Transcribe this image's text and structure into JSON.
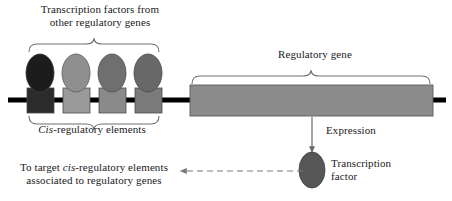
{
  "figure": {
    "background_color": "#ffffff",
    "width": 452,
    "height": 201
  },
  "labels": {
    "tf_source_line1": "Transcription factors from",
    "tf_source_line2": "other regulatory genes",
    "cis_elements_italic": "Cis",
    "cis_elements_rest": "-regulatory elements",
    "target_line1_pre": "To target ",
    "target_line1_italic": "cis",
    "target_line1_post": "-regulatory elements",
    "target_line2": "associated to regulatory genes",
    "regulatory_gene": "Regulatory gene",
    "expression": "Expression",
    "transcription_factor_line1": "Transcription",
    "transcription_factor_line2": "factor"
  },
  "colors": {
    "dna_strand": "#000000",
    "outline": "#4d4d4d",
    "brace": "#6e6e6e",
    "text": "#1a1a1a",
    "oval_1": "#1c1c1c",
    "oval_2": "#8f8f8f",
    "oval_3": "#6f6f6f",
    "oval_4": "#686868",
    "oval_product": "#575757",
    "box_1": "#2b2b2b",
    "box_2": "#9a9a9a",
    "box_3": "#8a8a8a",
    "box_4": "#7b7b7b",
    "regulatory_gene_fill": "#8c8c8c",
    "arrow": "#6a6a6a",
    "dashed_arrow": "#7a7a7a"
  },
  "elements": {
    "transcription_factors": [
      {
        "name": "tf-oval-1",
        "shade": "#1c1c1c",
        "cx": 40,
        "cy": 73,
        "rx": 14,
        "ry": 19
      },
      {
        "name": "tf-oval-2",
        "shade": "#8f8f8f",
        "cx": 76,
        "cy": 73,
        "rx": 14,
        "ry": 19
      },
      {
        "name": "tf-oval-3",
        "shade": "#6f6f6f",
        "cx": 112,
        "cy": 73,
        "rx": 14,
        "ry": 19
      },
      {
        "name": "tf-oval-4",
        "shade": "#686868",
        "cx": 148,
        "cy": 73,
        "rx": 14,
        "ry": 19
      }
    ],
    "cis_regulatory_elements": [
      {
        "name": "cis-box-1",
        "shade": "#2b2b2b",
        "x": 27,
        "y": 88,
        "w": 27,
        "h": 25
      },
      {
        "name": "cis-box-2",
        "shade": "#9a9a9a",
        "x": 63,
        "y": 88,
        "w": 27,
        "h": 25
      },
      {
        "name": "cis-box-3",
        "shade": "#8a8a8a",
        "x": 99,
        "y": 88,
        "w": 27,
        "h": 25
      },
      {
        "name": "cis-box-4",
        "shade": "#7b7b7b",
        "x": 135,
        "y": 88,
        "w": 27,
        "h": 25
      }
    ],
    "regulatory_gene_box": {
      "x": 190,
      "y": 85,
      "w": 243,
      "h": 31,
      "shade": "#8c8c8c"
    },
    "dna_strand": {
      "x1": 8,
      "x2": 446,
      "y": 100,
      "thickness": 5
    },
    "product_oval": {
      "name": "product-oval",
      "cx": 312,
      "cy": 170,
      "rx": 13,
      "ry": 18,
      "shade": "#575757"
    },
    "expression_arrow": {
      "x": 312,
      "y1": 117,
      "y2": 150
    },
    "feedback_arrow": {
      "x1": 303,
      "x2": 183,
      "y": 171,
      "style": "dashed"
    }
  }
}
